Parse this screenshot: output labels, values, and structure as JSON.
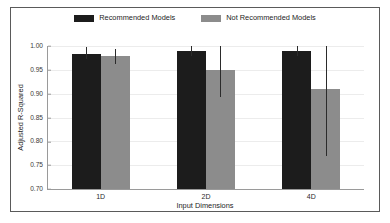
{
  "chart_data": {
    "type": "bar",
    "title": "",
    "subtitle": "",
    "xlabel": "Input Dimensions",
    "ylabel": "Adjusted R-Squared",
    "categories": [
      "1D",
      "2D",
      "4D"
    ],
    "ylim": [
      0.7,
      1.0
    ],
    "yticks": [
      "0.70",
      "0.75",
      "0.80",
      "0.85",
      "0.90",
      "0.95",
      "1.00"
    ],
    "ytick_values": [
      0.7,
      0.75,
      0.8,
      0.85,
      0.9,
      0.95,
      1.0
    ],
    "grid": true,
    "grid_axis": "y",
    "legend_position": "top-center",
    "series": [
      {
        "name": "Recommended Models",
        "color": "#1c1c1c",
        "values": [
          0.983,
          0.99,
          0.99
        ],
        "error_low": [
          0.972,
          0.98,
          0.98
        ],
        "error_high": [
          0.997,
          1.0,
          1.0
        ]
      },
      {
        "name": "Not Recommended Models",
        "color": "#8c8c8c",
        "values": [
          0.98,
          0.95,
          0.91
        ],
        "error_low": [
          0.963,
          0.894,
          0.77
        ],
        "error_high": [
          0.994,
          1.005,
          1.002
        ]
      }
    ]
  },
  "figure": {
    "border_color": "#5a5a5a",
    "background": "#ffffff",
    "axis_color": "#9a9a9a",
    "gridline_color": "#ececec",
    "errorbar_color": "#2b2b2b"
  }
}
